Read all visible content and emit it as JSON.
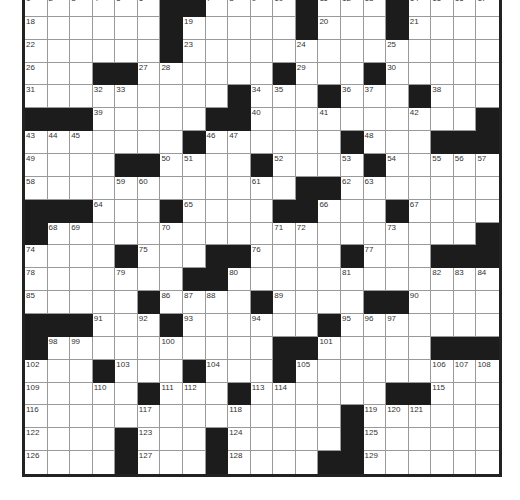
{
  "puzzle": {
    "rows": 21,
    "cols": 21,
    "colors": {
      "block": "#1c1c1c",
      "cell": "#ffffff",
      "gridline": "#9a9a9a",
      "border": "#222222"
    },
    "grid": [
      "......##....#...#....",
      "......#.....#...#....",
      "......#..............",
      "...##......#...#.....",
      ".........#...#...#...",
      "###.....##..........#",
      ".......#......#...###",
      "....##....#....#.....",
      "............##.......",
      "###...#....##...#....",
      "#...................#",
      "....#...##....#...###",
      ".......##............",
      ".....#....#....##....",
      "###...#......#.......",
      "#..........##.....###",
      "...#...#...#.........",
      ".....#...#......##...",
      "..............#......",
      "....#...#.....#......",
      "....#...#....##......"
    ],
    "numbers": [
      {
        "n": 1,
        "r": 0,
        "c": 0
      },
      {
        "n": 2,
        "r": 0,
        "c": 1
      },
      {
        "n": 3,
        "r": 0,
        "c": 2
      },
      {
        "n": 4,
        "r": 0,
        "c": 3
      },
      {
        "n": 5,
        "r": 0,
        "c": 4
      },
      {
        "n": 6,
        "r": 0,
        "c": 5
      },
      {
        "n": 7,
        "r": 0,
        "c": 8
      },
      {
        "n": 8,
        "r": 0,
        "c": 9
      },
      {
        "n": 9,
        "r": 0,
        "c": 10
      },
      {
        "n": 10,
        "r": 0,
        "c": 11
      },
      {
        "n": 11,
        "r": 0,
        "c": 13
      },
      {
        "n": 12,
        "r": 0,
        "c": 14
      },
      {
        "n": 13,
        "r": 0,
        "c": 15
      },
      {
        "n": 14,
        "r": 0,
        "c": 17
      },
      {
        "n": 15,
        "r": 0,
        "c": 18
      },
      {
        "n": 16,
        "r": 0,
        "c": 19
      },
      {
        "n": 17,
        "r": 0,
        "c": 20
      },
      {
        "n": 18,
        "r": 1,
        "c": 0
      },
      {
        "n": 19,
        "r": 1,
        "c": 7
      },
      {
        "n": 20,
        "r": 1,
        "c": 13
      },
      {
        "n": 21,
        "r": 1,
        "c": 17
      },
      {
        "n": 22,
        "r": 2,
        "c": 0
      },
      {
        "n": 23,
        "r": 2,
        "c": 7
      },
      {
        "n": 24,
        "r": 2,
        "c": 12
      },
      {
        "n": 25,
        "r": 2,
        "c": 16
      },
      {
        "n": 26,
        "r": 3,
        "c": 0
      },
      {
        "n": 27,
        "r": 3,
        "c": 5
      },
      {
        "n": 28,
        "r": 3,
        "c": 6
      },
      {
        "n": 29,
        "r": 3,
        "c": 12
      },
      {
        "n": 30,
        "r": 3,
        "c": 16
      },
      {
        "n": 31,
        "r": 4,
        "c": 0
      },
      {
        "n": 32,
        "r": 4,
        "c": 3
      },
      {
        "n": 33,
        "r": 4,
        "c": 4
      },
      {
        "n": 34,
        "r": 4,
        "c": 10
      },
      {
        "n": 35,
        "r": 4,
        "c": 11
      },
      {
        "n": 36,
        "r": 4,
        "c": 14
      },
      {
        "n": 37,
        "r": 4,
        "c": 15
      },
      {
        "n": 38,
        "r": 4,
        "c": 18
      },
      {
        "n": 39,
        "r": 5,
        "c": 3
      },
      {
        "n": 40,
        "r": 5,
        "c": 10
      },
      {
        "n": 41,
        "r": 5,
        "c": 13
      },
      {
        "n": 42,
        "r": 5,
        "c": 17
      },
      {
        "n": 43,
        "r": 6,
        "c": 0
      },
      {
        "n": 44,
        "r": 6,
        "c": 1
      },
      {
        "n": 45,
        "r": 6,
        "c": 2
      },
      {
        "n": 46,
        "r": 6,
        "c": 8
      },
      {
        "n": 47,
        "r": 6,
        "c": 9
      },
      {
        "n": 48,
        "r": 6,
        "c": 15
      },
      {
        "n": 49,
        "r": 7,
        "c": 0
      },
      {
        "n": 50,
        "r": 7,
        "c": 6
      },
      {
        "n": 51,
        "r": 7,
        "c": 7
      },
      {
        "n": 52,
        "r": 7,
        "c": 11
      },
      {
        "n": 53,
        "r": 7,
        "c": 14
      },
      {
        "n": 54,
        "r": 7,
        "c": 16
      },
      {
        "n": 55,
        "r": 7,
        "c": 18
      },
      {
        "n": 56,
        "r": 7,
        "c": 19
      },
      {
        "n": 57,
        "r": 7,
        "c": 20
      },
      {
        "n": 58,
        "r": 8,
        "c": 0
      },
      {
        "n": 59,
        "r": 8,
        "c": 4
      },
      {
        "n": 60,
        "r": 8,
        "c": 5
      },
      {
        "n": 61,
        "r": 8,
        "c": 10
      },
      {
        "n": 62,
        "r": 8,
        "c": 14
      },
      {
        "n": 63,
        "r": 8,
        "c": 15
      },
      {
        "n": 64,
        "r": 9,
        "c": 3
      },
      {
        "n": 65,
        "r": 9,
        "c": 7
      },
      {
        "n": 66,
        "r": 9,
        "c": 13
      },
      {
        "n": 67,
        "r": 9,
        "c": 17
      },
      {
        "n": 68,
        "r": 10,
        "c": 1
      },
      {
        "n": 69,
        "r": 10,
        "c": 2
      },
      {
        "n": 70,
        "r": 10,
        "c": 6
      },
      {
        "n": 71,
        "r": 10,
        "c": 11
      },
      {
        "n": 72,
        "r": 10,
        "c": 12
      },
      {
        "n": 73,
        "r": 10,
        "c": 16
      },
      {
        "n": 74,
        "r": 11,
        "c": 0
      },
      {
        "n": 75,
        "r": 11,
        "c": 5
      },
      {
        "n": 76,
        "r": 11,
        "c": 10
      },
      {
        "n": 77,
        "r": 11,
        "c": 15
      },
      {
        "n": 78,
        "r": 12,
        "c": 0
      },
      {
        "n": 79,
        "r": 12,
        "c": 4
      },
      {
        "n": 80,
        "r": 12,
        "c": 9
      },
      {
        "n": 81,
        "r": 12,
        "c": 14
      },
      {
        "n": 82,
        "r": 12,
        "c": 18
      },
      {
        "n": 83,
        "r": 12,
        "c": 19
      },
      {
        "n": 84,
        "r": 12,
        "c": 20
      },
      {
        "n": 85,
        "r": 13,
        "c": 0
      },
      {
        "n": 86,
        "r": 13,
        "c": 6
      },
      {
        "n": 87,
        "r": 13,
        "c": 7
      },
      {
        "n": 88,
        "r": 13,
        "c": 8
      },
      {
        "n": 89,
        "r": 13,
        "c": 11
      },
      {
        "n": 90,
        "r": 13,
        "c": 17
      },
      {
        "n": 91,
        "r": 14,
        "c": 3
      },
      {
        "n": 92,
        "r": 14,
        "c": 5
      },
      {
        "n": 93,
        "r": 14,
        "c": 7
      },
      {
        "n": 94,
        "r": 14,
        "c": 10
      },
      {
        "n": 95,
        "r": 14,
        "c": 14
      },
      {
        "n": 96,
        "r": 14,
        "c": 15
      },
      {
        "n": 97,
        "r": 14,
        "c": 16
      },
      {
        "n": 98,
        "r": 15,
        "c": 1
      },
      {
        "n": 99,
        "r": 15,
        "c": 2
      },
      {
        "n": 100,
        "r": 15,
        "c": 6
      },
      {
        "n": 101,
        "r": 15,
        "c": 13
      },
      {
        "n": 102,
        "r": 16,
        "c": 0
      },
      {
        "n": 103,
        "r": 16,
        "c": 4
      },
      {
        "n": 104,
        "r": 16,
        "c": 8
      },
      {
        "n": 105,
        "r": 16,
        "c": 12
      },
      {
        "n": 106,
        "r": 16,
        "c": 18
      },
      {
        "n": 107,
        "r": 16,
        "c": 19
      },
      {
        "n": 108,
        "r": 16,
        "c": 20
      },
      {
        "n": 109,
        "r": 17,
        "c": 0
      },
      {
        "n": 110,
        "r": 17,
        "c": 3
      },
      {
        "n": 111,
        "r": 17,
        "c": 6
      },
      {
        "n": 112,
        "r": 17,
        "c": 7
      },
      {
        "n": 113,
        "r": 17,
        "c": 10
      },
      {
        "n": 114,
        "r": 17,
        "c": 11
      },
      {
        "n": 115,
        "r": 17,
        "c": 18
      },
      {
        "n": 116,
        "r": 18,
        "c": 0
      },
      {
        "n": 117,
        "r": 18,
        "c": 5
      },
      {
        "n": 118,
        "r": 18,
        "c": 9
      },
      {
        "n": 119,
        "r": 18,
        "c": 15
      },
      {
        "n": 120,
        "r": 18,
        "c": 16
      },
      {
        "n": 121,
        "r": 18,
        "c": 17
      },
      {
        "n": 122,
        "r": 19,
        "c": 0
      },
      {
        "n": 123,
        "r": 19,
        "c": 5
      },
      {
        "n": 124,
        "r": 19,
        "c": 9
      },
      {
        "n": 125,
        "r": 19,
        "c": 15
      },
      {
        "n": 126,
        "r": 20,
        "c": 0
      },
      {
        "n": 127,
        "r": 20,
        "c": 5
      },
      {
        "n": 128,
        "r": 20,
        "c": 9
      },
      {
        "n": 129,
        "r": 20,
        "c": 15
      }
    ]
  }
}
